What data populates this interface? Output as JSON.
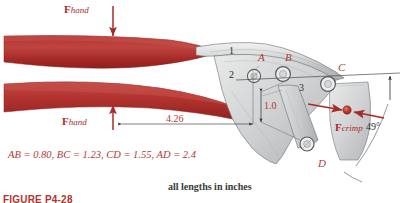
{
  "figure": {
    "caption": "FIGURE P4-28",
    "note": "all lengths in inches",
    "dimension_equation": "AB = 0.80, BC = 1.23, CD = 1.55, AD = 2.4"
  },
  "colors": {
    "handle_red": "#b5332f",
    "handle_red_dark": "#9e2622",
    "handle_red_light": "#c9514b",
    "label_red": "#b03a36",
    "force_red": "#a82a28",
    "body_gray": "#d9dada",
    "body_gray_dark": "#a9acae",
    "body_gray_light": "#eceded",
    "outline": "#5a5d5f",
    "text_dark": "#2d2d2d"
  },
  "forces": [
    {
      "id": "f-hand-top",
      "symbol": "F",
      "subscript": "hand",
      "direction": "down"
    },
    {
      "id": "f-hand-bottom",
      "symbol": "F",
      "subscript": "hand",
      "direction": "up"
    },
    {
      "id": "f-crimp",
      "symbol": "F",
      "subscript": "crimp",
      "direction": "opposing-horizontal"
    }
  ],
  "joints": [
    {
      "label": "A"
    },
    {
      "label": "B"
    },
    {
      "label": "C"
    },
    {
      "label": "D"
    }
  ],
  "links": [
    {
      "label": "1"
    },
    {
      "label": "2"
    },
    {
      "label": "3"
    }
  ],
  "dimensions": [
    {
      "label": "4.26",
      "orientation": "horizontal"
    },
    {
      "label": "1.0",
      "orientation": "vertical"
    },
    {
      "label": "49°",
      "orientation": "angular"
    }
  ]
}
